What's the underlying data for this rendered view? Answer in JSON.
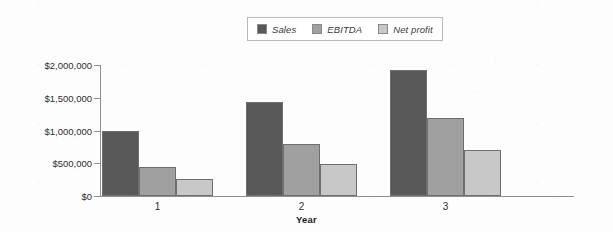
{
  "chart_data": {
    "type": "bar",
    "title": "",
    "xlabel": "Year",
    "ylabel": "",
    "categories": [
      "1",
      "2",
      "3"
    ],
    "series": [
      {
        "name": "Sales",
        "color": "#595959",
        "values": [
          985000,
          1430000,
          1920000
        ]
      },
      {
        "name": "EBITDA",
        "color": "#a0a0a0",
        "values": [
          450000,
          800000,
          1195000
        ]
      },
      {
        "name": "Net profit",
        "color": "#c8c8c8",
        "values": [
          260000,
          485000,
          700000
        ]
      }
    ],
    "ylim": [
      0,
      2000000
    ],
    "ytick_values": [
      0,
      500000,
      1000000,
      1500000,
      2000000
    ],
    "ytick_labels": [
      "$0",
      "$500,000",
      "$1,000,000",
      "$1,500,000",
      "$2,000,000"
    ],
    "grid": false,
    "legend_position": "top-center"
  },
  "legend": {
    "items": [
      {
        "label": "Sales",
        "color": "#595959"
      },
      {
        "label": "EBITDA",
        "color": "#a0a0a0"
      },
      {
        "label": "Net profit",
        "color": "#c8c8c8"
      }
    ]
  },
  "axis": {
    "x_title": "Year"
  }
}
